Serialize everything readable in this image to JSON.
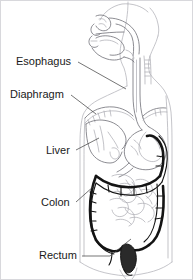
{
  "figure": {
    "background_color": "#ffffff",
    "width": 193,
    "height": 280,
    "style": "black and white line drawing, human torso in profile",
    "text_color": "#1a1a1a",
    "leader_line_color": "#3a3a3a",
    "faint_line_color": "#a9a9b0",
    "bold_line_color": "#141414"
  },
  "labels": [
    {
      "id": "esophagus",
      "text": "Esophagus",
      "x": 16,
      "y": 62,
      "leader": {
        "x1": 78,
        "y1": 62,
        "x2": 126,
        "y2": 89
      }
    },
    {
      "id": "diaphragm",
      "text": "Diaphragm",
      "x": 10,
      "y": 95,
      "leader": {
        "x1": 71,
        "y1": 95,
        "x2": 96,
        "y2": 114
      }
    },
    {
      "id": "liver",
      "text": "Liver",
      "x": 46,
      "y": 151,
      "leader": {
        "x1": 76,
        "y1": 150,
        "x2": 99,
        "y2": 138
      }
    },
    {
      "id": "colon",
      "text": "Colon",
      "x": 41,
      "y": 203,
      "leader": {
        "x1": 76,
        "y1": 202,
        "x2": 94,
        "y2": 186
      }
    },
    {
      "id": "rectum",
      "text": "Rectum",
      "x": 39,
      "y": 256,
      "leader": {
        "x1": 82,
        "y1": 256,
        "x2": 131,
        "y2": 239
      }
    }
  ],
  "organs": [
    {
      "id": "head-profile",
      "name": "head and face profile"
    },
    {
      "id": "nasal-cavity",
      "name": "nasal cavity"
    },
    {
      "id": "oral-cavity",
      "name": "oral cavity and tongue"
    },
    {
      "id": "pharynx",
      "name": "pharynx"
    },
    {
      "id": "esophagus-tube",
      "name": "esophagus"
    },
    {
      "id": "diaphragm-dome",
      "name": "diaphragm"
    },
    {
      "id": "stomach",
      "name": "stomach"
    },
    {
      "id": "liver-organ",
      "name": "liver"
    },
    {
      "id": "small-intestine",
      "name": "small intestine"
    },
    {
      "id": "colon-frame",
      "name": "colon"
    },
    {
      "id": "rectum-organ",
      "name": "rectum"
    },
    {
      "id": "torso-outline",
      "name": "torso outline"
    }
  ]
}
